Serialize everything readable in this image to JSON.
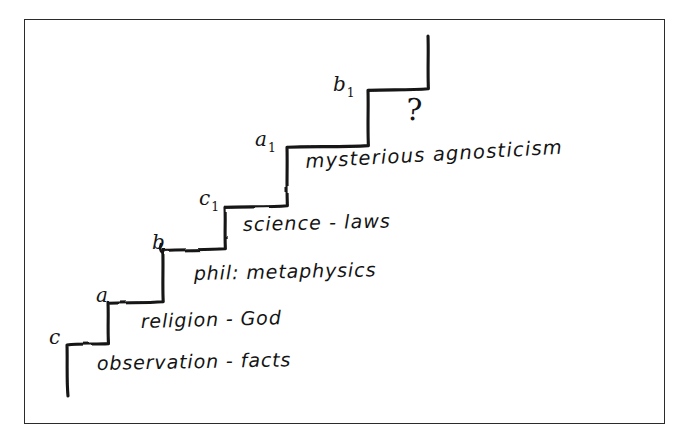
{
  "diagram": {
    "ink_color": "#141414",
    "frame_color": "#2b2b2b",
    "background_color": "#ffffff",
    "question_mark": "?",
    "step_labels": [
      {
        "id": "c",
        "base": "c",
        "subscript": "",
        "x": 49,
        "y": 325
      },
      {
        "id": "a",
        "base": "a",
        "subscript": "",
        "x": 96,
        "y": 283
      },
      {
        "id": "b",
        "base": "b",
        "subscript": "",
        "x": 152,
        "y": 230
      },
      {
        "id": "c1",
        "base": "c",
        "subscript": "1",
        "x": 199,
        "y": 186
      },
      {
        "id": "a1",
        "base": "a",
        "subscript": "1",
        "x": 255,
        "y": 127
      },
      {
        "id": "b1",
        "base": "b",
        "subscript": "1",
        "x": 333,
        "y": 72
      }
    ],
    "tier_labels": [
      {
        "id": "observation",
        "text": "observation - facts"
      },
      {
        "id": "religion",
        "text": "religion - God"
      },
      {
        "id": "phil",
        "text": "phil: metaphysics"
      },
      {
        "id": "science",
        "text": "science - laws"
      },
      {
        "id": "mysterious",
        "text": "mysterious agnosticism"
      }
    ],
    "staircase_path": "M 67 396 L 67 345 L 108 344 L 108 303 L 163 302 L 163 250 L 225 249 L 225 207 L 287 206 L 287 147 L 368 146 L 368 90 L 428 89 L 428 36"
  }
}
